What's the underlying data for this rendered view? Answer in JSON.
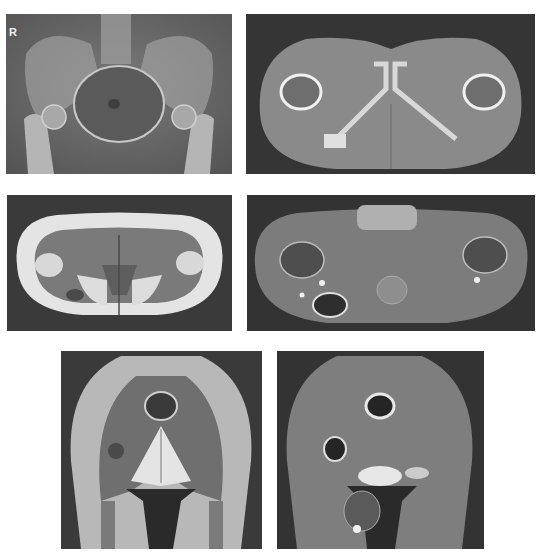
{
  "figure": {
    "panels": [
      {
        "id": "xray-ap-pelvis",
        "modality": "X-ray (AP pelvis)",
        "label": "R"
      },
      {
        "id": "ct-axial-pelvis",
        "modality": "CT axial (bone window)"
      },
      {
        "id": "mri-axial-t1",
        "modality": "MRI axial T1"
      },
      {
        "id": "mri-axial-stir",
        "modality": "MRI axial fat-suppressed"
      },
      {
        "id": "mri-coronal-t1",
        "modality": "MRI coronal T1"
      },
      {
        "id": "mri-coronal-stir",
        "modality": "MRI coronal fat-suppressed"
      }
    ]
  },
  "colors": {
    "background": "#ffffff",
    "panel_dark": "#3a3a3a",
    "soft_tissue": "#8a8a8a",
    "bone": "#e6e6e6",
    "fat_t1": "#dcdcdc"
  }
}
